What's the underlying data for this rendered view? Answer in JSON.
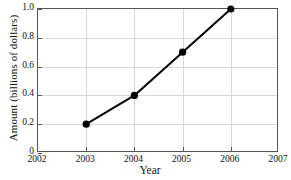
{
  "chart_data": {
    "type": "line",
    "title": "",
    "xlabel": "Year",
    "ylabel": "Amount (billions of dollars)",
    "x": [
      2003,
      2004,
      2005,
      2006
    ],
    "values": [
      0.2,
      0.4,
      0.7,
      1.0
    ],
    "series": [
      {
        "name": "Amount",
        "x": [
          2003,
          2004,
          2005,
          2006
        ],
        "values": [
          0.2,
          0.4,
          0.7,
          1.0
        ]
      }
    ],
    "xlim": [
      2002,
      2007
    ],
    "ylim": [
      0,
      1.0
    ],
    "xticks": [
      2002,
      2003,
      2004,
      2005,
      2006,
      2007
    ],
    "xtick_labels": [
      "2002",
      "2003",
      "2004",
      "2005",
      "2006",
      "2007"
    ],
    "yticks": [
      0,
      0.2,
      0.4,
      0.6,
      0.8,
      1.0
    ],
    "ytick_labels": [
      "0",
      "0.2",
      "0.4",
      "0.6",
      "0.8",
      "1.0"
    ],
    "grid": true,
    "legend": "none",
    "line_color": "#000000",
    "marker_color": "#000000",
    "grid_color": "#d8d8d8",
    "axis_color": "#555555"
  }
}
